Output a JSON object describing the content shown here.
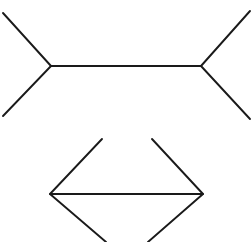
{
  "figure": {
    "name": "Müller-Lyer illusion",
    "background_color": "#ffffff",
    "stroke_color": "#1a1a1a",
    "stroke_width": 1.9,
    "canvas": {
      "width": 252,
      "height": 242
    }
  },
  "chart_data": {
    "type": "line",
    "subtitle": "Two equal-length horizontal shafts with opposing fin orientations",
    "xlabel": "",
    "ylabel": "",
    "xlim": [
      0,
      252
    ],
    "ylim": [
      0,
      242
    ],
    "grid": false,
    "legend": "none",
    "annotations": [
      "Top figure: fins point outward (arrow-out) — shaft appears longer",
      "Bottom figure: fins point inward (arrow-in) — shaft appears shorter",
      "Both shafts measure the same length in pixels"
    ],
    "series": [
      {
        "name": "top-shaft",
        "role": "shaft",
        "figure": "top",
        "x": [
          51,
          201
        ],
        "y": [
          66,
          66
        ],
        "length_px": 150
      },
      {
        "name": "top-fin-upper-left",
        "role": "fin",
        "figure": "top",
        "x": [
          51,
          3
        ],
        "y": [
          66,
          13
        ]
      },
      {
        "name": "top-fin-lower-left",
        "role": "fin",
        "figure": "top",
        "x": [
          51,
          3
        ],
        "y": [
          66,
          116
        ]
      },
      {
        "name": "top-fin-upper-right",
        "role": "fin",
        "figure": "top",
        "x": [
          201,
          250
        ],
        "y": [
          66,
          11
        ]
      },
      {
        "name": "top-fin-lower-right",
        "role": "fin",
        "figure": "top",
        "x": [
          201,
          250
        ],
        "y": [
          66,
          119
        ]
      },
      {
        "name": "bottom-shaft",
        "role": "shaft",
        "figure": "bottom",
        "x": [
          50,
          203
        ],
        "y": [
          194,
          194
        ],
        "length_px": 153
      },
      {
        "name": "bottom-fin-upper-left",
        "role": "fin",
        "figure": "bottom",
        "x": [
          50,
          102
        ],
        "y": [
          194,
          139
        ]
      },
      {
        "name": "bottom-fin-lower-left",
        "role": "fin",
        "figure": "bottom",
        "x": [
          50,
          106
        ],
        "y": [
          194,
          242
        ]
      },
      {
        "name": "bottom-fin-upper-right",
        "role": "fin",
        "figure": "bottom",
        "x": [
          203,
          152
        ],
        "y": [
          194,
          139
        ]
      },
      {
        "name": "bottom-fin-lower-right",
        "role": "fin",
        "figure": "bottom",
        "x": [
          203,
          148
        ],
        "y": [
          194,
          242
        ]
      }
    ],
    "vertices": {
      "top_left": [
        51,
        66
      ],
      "top_right": [
        201,
        66
      ],
      "bottom_left": [
        50,
        194
      ],
      "bottom_right": [
        203,
        194
      ]
    }
  }
}
